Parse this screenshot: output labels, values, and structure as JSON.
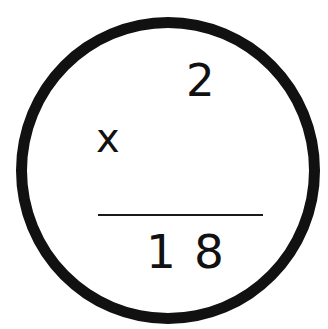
{
  "problem": {
    "top_number": "2",
    "operator": "x",
    "bottom_number": "",
    "result": "18"
  },
  "colors": {
    "ink": "#111111",
    "background": "#ffffff"
  }
}
